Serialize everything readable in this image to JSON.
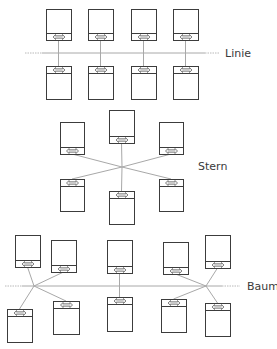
{
  "diagram": {
    "colors": {
      "box_stroke": "#3c3c3c",
      "line": "#a8a8a8",
      "dotted": "#b8b8b8",
      "label": "#3a3a3a",
      "connector_fill": "#e8e8e8"
    },
    "topologies": [
      {
        "id": "linie",
        "label": "Linie",
        "label_pos": [
          225,
          57
        ],
        "bus": {
          "y": 53,
          "x1": 25,
          "x2": 220,
          "solid_from": 42,
          "solid_to": 205
        },
        "nodes": [
          {
            "x": 46,
            "y": 9,
            "w": 25,
            "h": 31,
            "port": "bottom",
            "to": [
              58.5,
              53
            ]
          },
          {
            "x": 88,
            "y": 9,
            "w": 25,
            "h": 31,
            "port": "bottom",
            "to": [
              100.5,
              53
            ]
          },
          {
            "x": 131,
            "y": 9,
            "w": 25,
            "h": 31,
            "port": "bottom",
            "to": [
              143.5,
              53
            ]
          },
          {
            "x": 173,
            "y": 9,
            "w": 25,
            "h": 31,
            "port": "bottom",
            "to": [
              185.5,
              53
            ]
          },
          {
            "x": 46,
            "y": 66,
            "w": 25,
            "h": 33,
            "port": "top",
            "to": [
              58.5,
              53
            ]
          },
          {
            "x": 88,
            "y": 66,
            "w": 25,
            "h": 33,
            "port": "top",
            "to": [
              100.5,
              53
            ]
          },
          {
            "x": 131,
            "y": 66,
            "w": 25,
            "h": 33,
            "port": "top",
            "to": [
              143.5,
              53
            ]
          },
          {
            "x": 173,
            "y": 66,
            "w": 25,
            "h": 33,
            "port": "top",
            "to": [
              185.5,
              53
            ]
          }
        ]
      },
      {
        "id": "stern",
        "label": "Stern",
        "label_pos": [
          198,
          170
        ],
        "hub": [
          122,
          167
        ],
        "nodes": [
          {
            "x": 109,
            "y": 110,
            "w": 25,
            "h": 33,
            "port": "bottom"
          },
          {
            "x": 60,
            "y": 122,
            "w": 24,
            "h": 32,
            "port": "bottom"
          },
          {
            "x": 159,
            "y": 122,
            "w": 24,
            "h": 32,
            "port": "bottom"
          },
          {
            "x": 60,
            "y": 179,
            "w": 24,
            "h": 32,
            "port": "top"
          },
          {
            "x": 159,
            "y": 179,
            "w": 24,
            "h": 32,
            "port": "top"
          },
          {
            "x": 109,
            "y": 191,
            "w": 25,
            "h": 33,
            "port": "top"
          }
        ]
      },
      {
        "id": "baum",
        "label": "Baum",
        "label_pos": [
          247,
          290
        ],
        "bus": {
          "y": 286,
          "x1": 5,
          "x2": 240,
          "solid_from": 22,
          "solid_to": 222
        },
        "hubs": [
          [
            34,
            286
          ],
          [
            206,
            286
          ]
        ],
        "nodes": [
          {
            "x": 15,
            "y": 235,
            "w": 25,
            "h": 32,
            "port": "bottom",
            "hub": 0
          },
          {
            "x": 51,
            "y": 240,
            "w": 25,
            "h": 32,
            "port": "bottom",
            "hub": 0
          },
          {
            "x": 107,
            "y": 240,
            "w": 25,
            "h": 33,
            "port": "bottom",
            "hub": -1,
            "to": [
              119.5,
              286
            ]
          },
          {
            "x": 163,
            "y": 242,
            "w": 25,
            "h": 32,
            "port": "bottom",
            "hub": 1
          },
          {
            "x": 205,
            "y": 235,
            "w": 25,
            "h": 33,
            "port": "bottom",
            "hub": 1
          },
          {
            "x": 7,
            "y": 309,
            "w": 25,
            "h": 33,
            "port": "top",
            "hub": 0
          },
          {
            "x": 53,
            "y": 301,
            "w": 26,
            "h": 33,
            "port": "top",
            "hub": 0
          },
          {
            "x": 107,
            "y": 297,
            "w": 25,
            "h": 34,
            "port": "top",
            "hub": -1,
            "to": [
              119.5,
              286
            ]
          },
          {
            "x": 161,
            "y": 299,
            "w": 25,
            "h": 33,
            "port": "top",
            "hub": 1
          },
          {
            "x": 205,
            "y": 303,
            "w": 25,
            "h": 33,
            "port": "top",
            "hub": 1
          }
        ]
      }
    ]
  }
}
